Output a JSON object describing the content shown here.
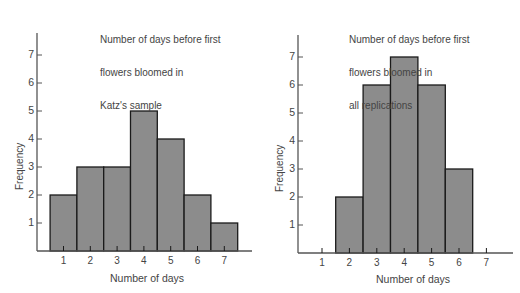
{
  "colors": {
    "bar_fill": "#8c8c8c",
    "bar_stroke": "#1a1a1a",
    "axis": "#555555",
    "text": "#444444"
  },
  "chart_data": [
    {
      "type": "bar",
      "title": "Number of days before first flowers bloomed in Katz's sample",
      "title_lines": [
        "Number of days before first",
        "flowers bloomed in",
        "Katz's sample"
      ],
      "categories": [
        "1",
        "2",
        "3",
        "4",
        "5",
        "6",
        "7"
      ],
      "values": [
        2,
        3,
        3,
        5,
        4,
        2,
        1
      ],
      "xlabel": "Number of days",
      "ylabel": "Frequency",
      "yticks": [
        "1",
        "2",
        "3",
        "4",
        "5",
        "6",
        "7"
      ],
      "xticks": [
        "1",
        "2",
        "3",
        "4",
        "5",
        "6",
        "7"
      ],
      "ylim": [
        0,
        7.7
      ],
      "grid": false,
      "legend": null
    },
    {
      "type": "bar",
      "title": "Number of days before first flowers bloomed in all replications",
      "title_lines": [
        "Number of days before first",
        "flowers bloomed in",
        "all replications"
      ],
      "categories": [
        "1",
        "2",
        "3",
        "4",
        "5",
        "6",
        "7"
      ],
      "values": [
        0,
        2,
        6,
        7,
        6,
        3,
        0
      ],
      "xlabel": "Number of days",
      "ylabel": "Frequency",
      "yticks": [
        "1",
        "2",
        "3",
        "4",
        "5",
        "6",
        "7"
      ],
      "xticks": [
        "1",
        "2",
        "3",
        "4",
        "5",
        "6",
        "7"
      ],
      "ylim": [
        0,
        7.7
      ],
      "grid": false,
      "legend": null
    }
  ]
}
